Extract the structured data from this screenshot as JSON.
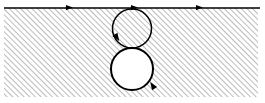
{
  "figure": {
    "type": "technical-line-diagram",
    "canvas": {
      "width": 265,
      "height": 103
    },
    "colors": {
      "background": "#ffffff",
      "stroke": "#000000",
      "hatch": "#555555",
      "circle_fill_lower": "#ffffff"
    }
  },
  "hatched_region": {
    "name": "hatched-half-plane",
    "x": 4,
    "y": 8,
    "width": 254,
    "height": 89,
    "hatch_angle_deg": 45,
    "hatch_direction": "lower-left-to-upper-right",
    "hatch_spacing_px": 4,
    "hatch_line_width_px": 0.8,
    "hatch_color": "#555555"
  },
  "boundary_line": {
    "name": "top-boundary-line",
    "x1": 4,
    "y1": 8,
    "x2": 260,
    "y2": 8,
    "stroke_width": 1.6,
    "direction": "rightward"
  },
  "arrows": [
    {
      "id": "arrow-boundary-left",
      "label": "boundary-arrow-1",
      "x": 71,
      "y": 7.6,
      "angle_deg": 0,
      "size": 7
    },
    {
      "id": "arrow-boundary-mid",
      "label": "boundary-arrow-2",
      "x": 136,
      "y": 7.6,
      "angle_deg": 0,
      "size": 7
    },
    {
      "id": "arrow-boundary-right",
      "label": "boundary-arrow-3",
      "x": 201,
      "y": 7.6,
      "angle_deg": 0,
      "size": 7
    },
    {
      "id": "arrow-upper-circle",
      "label": "upper-circle-orientation-arrow",
      "x": 117,
      "y": 41,
      "angle_deg": 57,
      "size": 8
    },
    {
      "id": "arrow-lower-circle",
      "label": "lower-circle-orientation-arrow",
      "x": 148,
      "y": 82,
      "angle_deg": 237,
      "size": 8
    }
  ],
  "circles": [
    {
      "id": "upper-circle",
      "label": "upper-circular-contour",
      "cx": 132,
      "cy": 28.5,
      "r": 19.5,
      "fill": "hatched",
      "stroke_width": 1.5,
      "description": "Upper circle tangent to the boundary line and to the lower circle; interior shows the same hatch pattern as the surrounding region."
    },
    {
      "id": "lower-circle",
      "label": "lower-circular-contour",
      "cx": 132,
      "cy": 69,
      "r": 21,
      "fill": "#ffffff",
      "stroke_width": 2.0,
      "description": "Lower circle tangent to the upper circle; interior is blank (white), representing a void or excluded region."
    }
  ]
}
